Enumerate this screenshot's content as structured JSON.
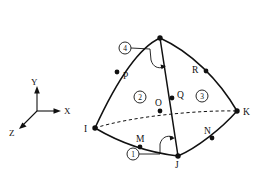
{
  "figure": {
    "type": "diagram",
    "background_color": "#ffffff",
    "line_color": "#111111"
  },
  "axes": {
    "name": "coordinate-triad",
    "origin": {
      "x": 37,
      "y": 111
    },
    "labels": {
      "x": "X",
      "y": "Y",
      "z": "Z"
    },
    "tips": {
      "x": {
        "x": 60,
        "y": 111
      },
      "y": {
        "x": 37,
        "y": 88
      },
      "z": {
        "x": 19,
        "y": 128
      }
    },
    "label_positions": {
      "x": {
        "x": 63,
        "y": 114
      },
      "y": {
        "x": 33,
        "y": 84
      },
      "z": {
        "x": 10,
        "y": 135
      }
    }
  },
  "element": {
    "name": "curved-tetrahedron",
    "corner_nodes": [
      {
        "id": "L",
        "label": "",
        "x": 160,
        "y": 38,
        "label_x": 160,
        "label_y": 30,
        "labelled": false
      },
      {
        "id": "I",
        "label": "I",
        "x": 95,
        "y": 128,
        "label_x": 85,
        "label_y": 131,
        "labelled": true
      },
      {
        "id": "J",
        "label": "J",
        "x": 178,
        "y": 156,
        "label_x": 176,
        "label_y": 167,
        "labelled": true
      },
      {
        "id": "K",
        "label": "K",
        "x": 237,
        "y": 111,
        "label_x": 243,
        "label_y": 114,
        "labelled": true
      }
    ],
    "midside_nodes": [
      {
        "id": "P",
        "label": "P",
        "x": 117,
        "y": 72,
        "label_x": 124,
        "label_y": 78
      },
      {
        "id": "R",
        "label": "R",
        "x": 206,
        "y": 71,
        "label_x": 193,
        "label_y": 72
      },
      {
        "id": "Q",
        "label": "Q",
        "x": 175,
        "y": 96,
        "label_x": 180,
        "label_y": 96
      },
      {
        "id": "O",
        "label": "O",
        "x": 166,
        "y": 110,
        "label_x": 162,
        "label_y": 104
      },
      {
        "id": "M",
        "label": "M",
        "x": 142,
        "y": 146,
        "label_x": 140,
        "label_y": 141
      },
      {
        "id": "N",
        "label": "N",
        "x": 212,
        "y": 137,
        "label_x": 205,
        "label_y": 132
      }
    ],
    "faces": [
      {
        "number": "1",
        "glyph": "①",
        "circle_x": 133,
        "circle_y": 154,
        "radius": 6
      },
      {
        "number": "2",
        "glyph": "②",
        "circle_x": 140,
        "circle_y": 97,
        "radius": 6
      },
      {
        "number": "3",
        "glyph": "③",
        "circle_x": 202,
        "circle_y": 96,
        "radius": 6
      },
      {
        "number": "4",
        "glyph": "④",
        "circle_x": 125,
        "circle_y": 48,
        "radius": 6
      }
    ],
    "edges": {
      "visible": [
        {
          "name": "edge-L-I",
          "path": "M 160 38 C 140 47 118 78 95 128"
        },
        {
          "name": "edge-L-J",
          "path": "M 160 38 C 166 75 172 118 178 156"
        },
        {
          "name": "edge-L-K",
          "path": "M 160 38 C 191 52 219 80 237 111"
        },
        {
          "name": "edge-I-J",
          "path": "M 95 128 C 122 144 152 153 178 156"
        },
        {
          "name": "edge-J-K",
          "path": "M 178 156 C 197 148 222 128 237 111"
        }
      ],
      "hidden": [
        {
          "name": "edge-I-K",
          "path": "M 95 128 C 133 116 200 110 237 111"
        }
      ]
    },
    "leaders": [
      {
        "name": "leader-face-4",
        "path": "M 131 48 L 150 48 L 150 60"
      },
      {
        "name": "leader-face-4-arrow",
        "path": "M 150 60 C 152 68 157 70 163 68"
      },
      {
        "name": "leader-face-1",
        "path": "M 139 154 L 160 154 L 160 143"
      },
      {
        "name": "leader-face-1-arrow",
        "path": "M 160 143 C 162 136 167 134 173 136"
      }
    ]
  }
}
